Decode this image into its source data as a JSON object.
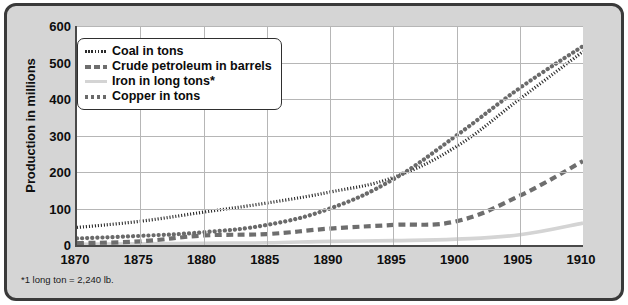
{
  "axis": {
    "ylabel": "Production in millions",
    "yticks": [
      "600",
      "500",
      "400",
      "300",
      "200",
      "100",
      "0"
    ],
    "xticks": [
      "1870",
      "1875",
      "1880",
      "1885",
      "1890",
      "1895",
      "1900",
      "1905",
      "1910"
    ]
  },
  "legend": {
    "items": [
      {
        "label": "Coal in tons",
        "style": "fine-dotted",
        "color": "#2b2b2b",
        "swatch_name": "coal"
      },
      {
        "label": "Crude petroleum in barrels",
        "style": "dashed",
        "color": "#6e6e6e",
        "swatch_name": "crude"
      },
      {
        "label": "Iron in long tons*",
        "style": "solid",
        "color": "#d4d4d4",
        "swatch_name": "iron"
      },
      {
        "label": "Copper in tons",
        "style": "dotted",
        "color": "#6a6a6a",
        "swatch_name": "copper"
      }
    ]
  },
  "footnote": "*1 long ton = 2,240 lb.",
  "colors": {
    "frame_border": "#3a3a3a",
    "frame_fill": "#d5d5d5",
    "plot_fill": "#ffffff",
    "grid": "#b6b6b6",
    "axis": "#4a4a4a"
  },
  "chart_data": {
    "type": "line",
    "title": "",
    "xlabel": "",
    "ylabel": "Production in millions",
    "xlim": [
      1870,
      1910
    ],
    "ylim": [
      0,
      600
    ],
    "grid": true,
    "legend_position": "top-left-inside",
    "annotations": [
      "*1 long ton = 2,240 lb."
    ],
    "x": [
      1870,
      1875,
      1880,
      1885,
      1890,
      1895,
      1900,
      1905,
      1910
    ],
    "series": [
      {
        "name": "Coal in tons",
        "unit": "tons",
        "style": "fine-dotted",
        "color": "#2b2b2b",
        "values": [
          48,
          65,
          90,
          115,
          145,
          185,
          270,
          400,
          530
        ]
      },
      {
        "name": "Crude petroleum in barrels",
        "unit": "barrels",
        "style": "dashed",
        "color": "#6e6e6e",
        "values": [
          5,
          10,
          26,
          30,
          45,
          55,
          65,
          135,
          230
        ]
      },
      {
        "name": "Iron in long tons*",
        "unit": "long tons",
        "style": "solid",
        "color": "#d4d4d4",
        "values": [
          2,
          3,
          5,
          6,
          10,
          12,
          16,
          28,
          60
        ]
      },
      {
        "name": "Copper in tons",
        "unit": "tons",
        "style": "dotted",
        "color": "#6a6a6a",
        "values": [
          18,
          25,
          35,
          55,
          100,
          180,
          300,
          430,
          545
        ]
      }
    ]
  }
}
